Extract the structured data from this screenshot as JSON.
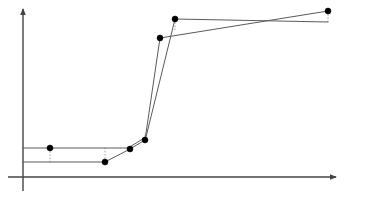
{
  "figure": {
    "name": "step-curve-plot",
    "background_color": "#ffffff",
    "width": 375,
    "height": 198
  },
  "chart_data": {
    "type": "line",
    "title": "",
    "subtitle": "",
    "xlabel": "",
    "ylabel": "",
    "grid": false,
    "legend": false,
    "legend_position": "none",
    "xlim": [
      0,
      375
    ],
    "ylim": [
      0,
      198
    ],
    "axes": {
      "origin_px": [
        23,
        177
      ],
      "y_axis": {
        "x": 23,
        "y_top": 9,
        "y_bottom": 191,
        "arrow": "up",
        "color": "#444444"
      },
      "x_axis": {
        "y": 177,
        "x_left": 8,
        "x_right": 336,
        "arrow": "right",
        "color": "#444444"
      }
    },
    "marker": {
      "shape": "circle",
      "color": "#000000",
      "radius_px": 3
    },
    "series": [
      {
        "name": "curve-lower-start",
        "color": "#5a5a5a",
        "width": 1,
        "style": "solid",
        "points_px": [
          [
            23,
            162
          ],
          [
            105,
            162
          ],
          [
            130,
            149
          ],
          [
            145,
            140
          ],
          [
            160,
            38
          ],
          [
            328,
            11
          ]
        ],
        "marker_points_px": [
          [
            105,
            162
          ],
          [
            130,
            149
          ],
          [
            145,
            140
          ],
          [
            160,
            38
          ],
          [
            328,
            11
          ]
        ]
      },
      {
        "name": "curve-upper-start",
        "color": "#5a5a5a",
        "width": 1,
        "style": "solid",
        "points_px": [
          [
            23,
            148
          ],
          [
            128,
            148
          ],
          [
            146,
            137
          ],
          [
            175,
            19
          ],
          [
            328,
            22
          ]
        ],
        "marker_points_px": [
          [
            50,
            148
          ],
          [
            175,
            19
          ]
        ]
      }
    ],
    "connectors": [
      {
        "name": "dashed-drop-left",
        "from_px": [
          50,
          148
        ],
        "to_px": [
          50,
          162
        ],
        "style": "dashed",
        "color": "#888888"
      },
      {
        "name": "dashed-rise-mid",
        "from_px": [
          105,
          162
        ],
        "to_px": [
          105,
          148
        ],
        "style": "dashed",
        "color": "#888888"
      },
      {
        "name": "dashed-link-knee",
        "from_px": [
          145,
          140
        ],
        "to_px": [
          145,
          133
        ],
        "style": "dashed",
        "color": "#888888"
      },
      {
        "name": "dashed-drop-upper",
        "from_px": [
          175,
          19
        ],
        "to_px": [
          175,
          30
        ],
        "style": "dashed",
        "color": "#888888"
      },
      {
        "name": "dashed-drop-right",
        "from_px": [
          328,
          11
        ],
        "to_px": [
          328,
          22
        ],
        "style": "dashed",
        "color": "#888888"
      }
    ],
    "annotations": [],
    "tick_labels": {
      "x": [],
      "y": []
    }
  }
}
